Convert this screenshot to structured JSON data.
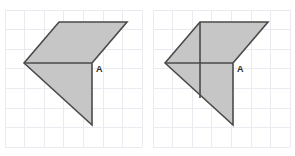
{
  "figure": {
    "panel_count": 2,
    "background_color": "#ffffff",
    "grid": {
      "line_color": "#eaeaf0",
      "spacing_px": 19.6,
      "columns": 7,
      "rows": 7,
      "visible": true
    },
    "shape_style": {
      "fill_color": "#c6c6c6",
      "stroke_color": "#4a4a4a",
      "stroke_width_px": 1.6,
      "interior_line_color": "#4a4a4a",
      "interior_line_width_px": 1.6
    }
  },
  "panels": [
    {
      "id": "panel-left",
      "name": "left-figure",
      "label_text": "A",
      "label_x": 96,
      "label_y": 72,
      "grid_origin_x": 5,
      "grid_origin_y": 10,
      "outline_points": "24,63 59,22 127,22 92,63 92,125 24,63",
      "parallelogram_points": "24,63 59,22 127,22 92,63",
      "triangle_points": "24,63 92,63 92,125",
      "shared_edge": {
        "x1": 24,
        "y1": 63,
        "x2": 92,
        "y2": 63
      },
      "interior_lines": []
    },
    {
      "id": "panel-right",
      "name": "right-figure",
      "label_text": "A",
      "label_x": 89,
      "label_y": 72,
      "grid_origin_x": 5,
      "grid_origin_y": 10,
      "outline_points": "17,63 52,22 120,22 85,63 85,125 17,63",
      "parallelogram_points": "17,63 52,22 120,22 85,63",
      "triangle_points": "17,63 85,63 85,125",
      "shared_edge": {
        "x1": 17,
        "y1": 63,
        "x2": 85,
        "y2": 63
      },
      "interior_lines": [
        {
          "name": "vertical-median",
          "x1": 52,
          "y1": 22,
          "x2": 52,
          "y2": 98
        }
      ]
    }
  ]
}
